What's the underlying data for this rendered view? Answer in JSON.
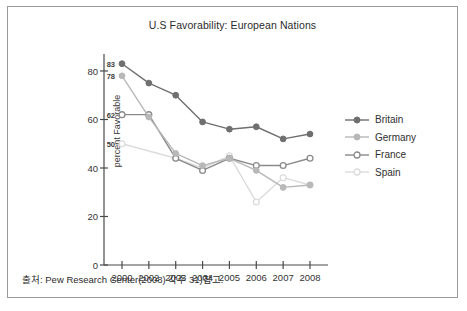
{
  "figure": {
    "title": "U.S Favorability: European Nations",
    "footer_note": "출처: Pew Research Center(2008) 각주 31)참고.",
    "border_color": "#9a9a9a",
    "background": "#ffffff"
  },
  "legend": {
    "position": "right",
    "entries": [
      {
        "label": "Britain",
        "color": "#6f6f6f",
        "marker": "filled-circle"
      },
      {
        "label": "Germany",
        "color": "#b8b8b8",
        "marker": "filled-circle"
      },
      {
        "label": "France",
        "color": "#8a8a8a",
        "marker": "open-circle"
      },
      {
        "label": "Spain",
        "color": "#dcdcdc",
        "marker": "open-circle"
      }
    ]
  },
  "chart_data": {
    "type": "line",
    "title": "U.S Favorability: European Nations",
    "xlabel": "",
    "ylabel": "percent Favorable",
    "categories": [
      "2000",
      "2002",
      "2003",
      "2004",
      "2005",
      "2006",
      "2007",
      "2008"
    ],
    "x_tick_labels": [
      "2000",
      "2002",
      "2003",
      "2004",
      "2005",
      "2006",
      "2007",
      "2008"
    ],
    "y_tick_labels": [
      "0",
      "20",
      "40",
      "60",
      "80"
    ],
    "y_ticks": [
      0,
      20,
      40,
      60,
      80
    ],
    "ylim": [
      0,
      87
    ],
    "grid": false,
    "series": [
      {
        "name": "Britain",
        "color": "#6f6f6f",
        "marker": "filled-circle",
        "values": [
          83,
          75,
          70,
          59,
          56,
          57,
          52,
          54
        ]
      },
      {
        "name": "Germany",
        "color": "#b8b8b8",
        "marker": "filled-circle",
        "values": [
          78,
          61,
          46,
          41,
          44,
          39,
          32,
          33
        ]
      },
      {
        "name": "France",
        "color": "#8a8a8a",
        "marker": "open-circle",
        "values": [
          62,
          62,
          44,
          39,
          44,
          41,
          41,
          44
        ]
      },
      {
        "name": "Spain",
        "color": "#dcdcdc",
        "marker": "open-circle",
        "values": [
          50,
          null,
          44,
          40,
          45,
          26,
          36,
          33
        ]
      }
    ],
    "annotations": [
      {
        "text": "83",
        "series": "Britain",
        "category": "2000",
        "value": 83
      },
      {
        "text": "78",
        "series": "Germany",
        "category": "2000",
        "value": 78
      },
      {
        "text": "62",
        "series": "France",
        "category": "2000",
        "value": 62
      },
      {
        "text": "50",
        "series": "Spain",
        "category": "2000",
        "value": 50
      }
    ]
  }
}
